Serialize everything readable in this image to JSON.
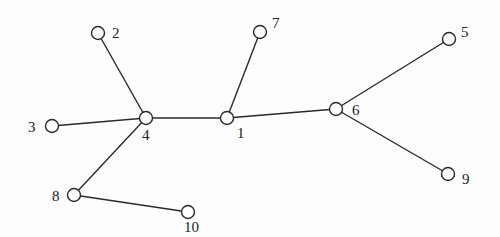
{
  "diagram": {
    "type": "tree-graph",
    "nodes": [
      {
        "id": "1",
        "label": "1"
      },
      {
        "id": "2",
        "label": "2"
      },
      {
        "id": "3",
        "label": "3"
      },
      {
        "id": "4",
        "label": "4"
      },
      {
        "id": "5",
        "label": "5"
      },
      {
        "id": "6",
        "label": "6"
      },
      {
        "id": "7",
        "label": "7"
      },
      {
        "id": "8",
        "label": "8"
      },
      {
        "id": "9",
        "label": "9"
      },
      {
        "id": "10",
        "label": "10"
      }
    ],
    "edges": [
      [
        "4",
        "2"
      ],
      [
        "4",
        "3"
      ],
      [
        "4",
        "1"
      ],
      [
        "4",
        "8"
      ],
      [
        "8",
        "10"
      ],
      [
        "1",
        "7"
      ],
      [
        "1",
        "6"
      ],
      [
        "6",
        "5"
      ],
      [
        "6",
        "9"
      ]
    ]
  }
}
